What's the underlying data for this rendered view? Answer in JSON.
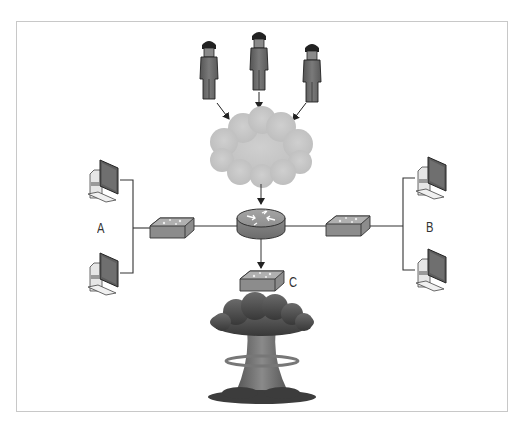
{
  "diagram": {
    "type": "network-attack-diagram",
    "labels": {
      "network_a": "A",
      "network_b": "B",
      "network_c": "C"
    },
    "nodes": [
      {
        "id": "attacker-1",
        "kind": "person",
        "icon": "attacker-icon"
      },
      {
        "id": "attacker-2",
        "kind": "person",
        "icon": "attacker-icon"
      },
      {
        "id": "attacker-3",
        "kind": "person",
        "icon": "attacker-icon"
      },
      {
        "id": "internet",
        "kind": "cloud",
        "icon": "cloud-icon"
      },
      {
        "id": "router",
        "kind": "router",
        "icon": "router-icon"
      },
      {
        "id": "switch-a",
        "kind": "switch",
        "icon": "switch-icon"
      },
      {
        "id": "switch-b",
        "kind": "switch",
        "icon": "switch-icon"
      },
      {
        "id": "switch-c",
        "kind": "switch",
        "icon": "switch-icon"
      },
      {
        "id": "pc-a1",
        "kind": "workstation",
        "icon": "computer-icon"
      },
      {
        "id": "pc-a2",
        "kind": "workstation",
        "icon": "computer-icon"
      },
      {
        "id": "pc-b1",
        "kind": "workstation",
        "icon": "computer-icon"
      },
      {
        "id": "pc-b2",
        "kind": "workstation",
        "icon": "computer-icon"
      },
      {
        "id": "explosion",
        "kind": "mushroom-cloud",
        "icon": "explosion-icon"
      }
    ],
    "edges": [
      {
        "from": "attacker-1",
        "to": "internet",
        "arrow": true
      },
      {
        "from": "attacker-2",
        "to": "internet",
        "arrow": true
      },
      {
        "from": "attacker-3",
        "to": "internet",
        "arrow": true
      },
      {
        "from": "internet",
        "to": "router",
        "arrow": true
      },
      {
        "from": "router",
        "to": "switch-c",
        "arrow": true
      },
      {
        "from": "router",
        "to": "switch-a",
        "arrow": false
      },
      {
        "from": "router",
        "to": "switch-b",
        "arrow": false
      },
      {
        "from": "switch-a",
        "to": "pc-a1",
        "arrow": false
      },
      {
        "from": "switch-a",
        "to": "pc-a2",
        "arrow": false
      },
      {
        "from": "switch-b",
        "to": "pc-b1",
        "arrow": false
      },
      {
        "from": "switch-b",
        "to": "pc-b2",
        "arrow": false
      }
    ],
    "colors": {
      "person": "#6e6e6e",
      "cloud": "#c4c4c4",
      "device": "#8f8f8f",
      "device_top": "#b4b4b4",
      "line": "#333333",
      "explosion": "#4a4a4a"
    }
  }
}
